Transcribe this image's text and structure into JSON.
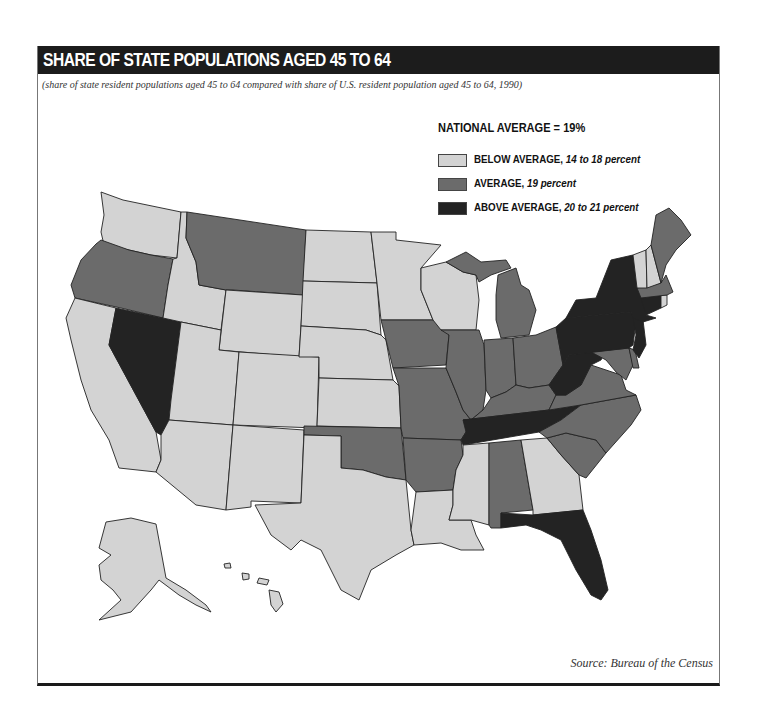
{
  "header": {
    "title": "SHARE OF STATE POPULATIONS AGED 45 TO 64",
    "subtitle": "(share of state resident populations aged 45 to 64 compared with share of U.S. resident population aged 45 to 64, 1990)"
  },
  "legend": {
    "title": "NATIONAL AVERAGE = 19%",
    "items": [
      {
        "key": "below",
        "label": "BELOW AVERAGE, ",
        "range": "14 to 18 percent",
        "color": "#d3d3d3"
      },
      {
        "key": "average",
        "label": "AVERAGE, ",
        "range": "19 percent",
        "color": "#6b6b6b"
      },
      {
        "key": "above",
        "label": "ABOVE AVERAGE, ",
        "range": "20 to 21 percent",
        "color": "#232323"
      }
    ]
  },
  "footer": {
    "source": "Source: Bureau of the Census"
  },
  "colors": {
    "below": "#d3d3d3",
    "average": "#6b6b6b",
    "above": "#232323",
    "title_bar": "#1c1c1c",
    "water": "#ffffff"
  },
  "map_data": {
    "national_average_percent": 19,
    "year": 1990,
    "states": {
      "WA": "below",
      "OR": "average",
      "CA": "below",
      "NV": "above",
      "ID": "below",
      "MT": "average",
      "WY": "below",
      "UT": "below",
      "AZ": "below",
      "CO": "below",
      "NM": "below",
      "ND": "below",
      "SD": "below",
      "NE": "below",
      "KS": "below",
      "OK": "average",
      "TX": "below",
      "MN": "below",
      "IA": "average",
      "MO": "average",
      "AR": "average",
      "LA": "below",
      "WI": "below",
      "IL": "average",
      "MI": "average",
      "IN": "average",
      "OH": "average",
      "KY": "average",
      "TN": "above",
      "MS": "below",
      "AL": "average",
      "GA": "below",
      "FL": "above",
      "SC": "average",
      "NC": "average",
      "VA": "average",
      "WV": "above",
      "MD": "average",
      "DE": "average",
      "PA": "above",
      "NJ": "above",
      "NY": "above",
      "CT": "above",
      "RI": "below",
      "MA": "average",
      "VT": "below",
      "NH": "below",
      "ME": "average",
      "AK": "below",
      "HI": "below"
    }
  }
}
